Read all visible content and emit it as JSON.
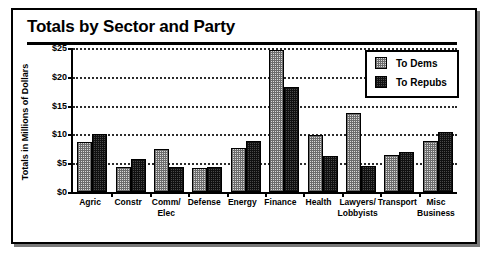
{
  "chart_data": {
    "type": "bar",
    "title": "Totals by Sector and Party",
    "xlabel": "",
    "ylabel": "Totals in Millions of Dollars",
    "ylim": [
      0,
      25
    ],
    "ytick_labels": [
      "$0",
      "$5",
      "$10",
      "$15",
      "$20",
      "$25"
    ],
    "ytick_values": [
      0,
      5,
      10,
      15,
      20,
      25
    ],
    "grid": true,
    "legend_position": "top-right",
    "categories": [
      "Agric",
      "Constr",
      "Comm/ Elec",
      "Defense",
      "Energy",
      "Finance",
      "Health",
      "Lawyers/ Lobbyists",
      "Transport",
      "Misc Business"
    ],
    "category_lines": [
      [
        "Agric"
      ],
      [
        "Constr"
      ],
      [
        "Comm/",
        "Elec"
      ],
      [
        "Defense"
      ],
      [
        "Energy"
      ],
      [
        "Finance"
      ],
      [
        "Health"
      ],
      [
        "Lawyers/",
        "Lobbyists"
      ],
      [
        "Transport"
      ],
      [
        "Misc",
        "Business"
      ]
    ],
    "series": [
      {
        "name": "To Dems",
        "swatch": "light-checker",
        "values": [
          8.6,
          4.4,
          7.5,
          4.2,
          7.6,
          24.7,
          9.9,
          13.8,
          6.4,
          8.9
        ]
      },
      {
        "name": "To Repubs",
        "swatch": "dark-checker",
        "values": [
          10.0,
          5.7,
          4.4,
          4.3,
          8.9,
          18.3,
          6.3,
          4.6,
          7.0,
          10.5
        ]
      }
    ]
  },
  "colors": {
    "dems_fill": "#dadada",
    "repubs_fill": "#4a4a4a",
    "outline": "#000000",
    "background": "#ffffff"
  },
  "legend": {
    "items": [
      {
        "label": "To Dems"
      },
      {
        "label": "To Repubs"
      }
    ]
  }
}
